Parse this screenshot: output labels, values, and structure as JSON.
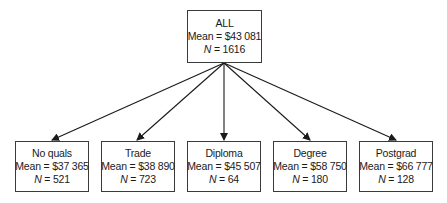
{
  "diagram": {
    "root": {
      "label": "ALL",
      "mean": "Mean = $43 081",
      "n_label": "N",
      "n_value": " = 1616"
    },
    "children": [
      {
        "label": "No quals",
        "mean": "Mean = $37 365",
        "n_label": "N",
        "n_value": " = 521"
      },
      {
        "label": "Trade",
        "mean": "Mean = $38 890",
        "n_label": "N",
        "n_value": " = 723"
      },
      {
        "label": "Diploma",
        "mean": "Mean = $45 507",
        "n_label": "N",
        "n_value": " = 64"
      },
      {
        "label": "Degree",
        "mean": "Mean = $58 750",
        "n_label": "N",
        "n_value": " = 180"
      },
      {
        "label": "Postgrad",
        "mean": "Mean = $66 777",
        "n_label": "N",
        "n_value": " = 128"
      }
    ]
  }
}
